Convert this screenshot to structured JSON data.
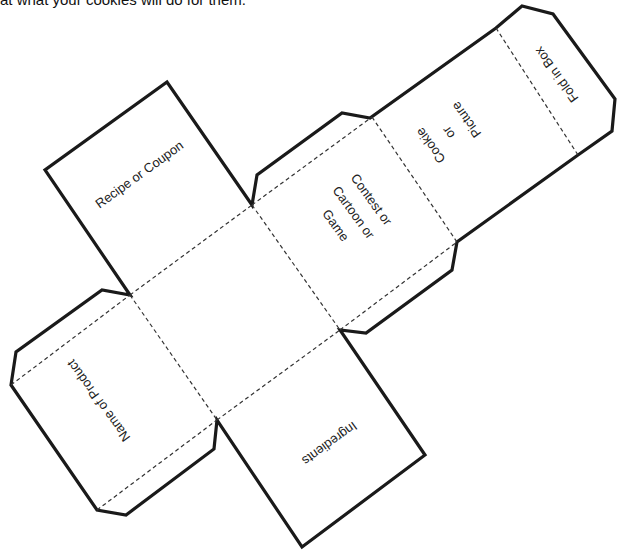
{
  "caption": "at what your cookies will do for them.",
  "panels": {
    "recipe": "Recipe or Coupon",
    "center": "",
    "contest": [
      "Contest or",
      "Cartoon or",
      "Game"
    ],
    "picture": [
      "Cookie",
      "or",
      "Picture"
    ],
    "fold": "Fold in Box",
    "name": "Name of Product",
    "ingredients": "Ingredients"
  },
  "colors": {
    "line": "#1a1a1a",
    "fold_line": "#333333"
  }
}
